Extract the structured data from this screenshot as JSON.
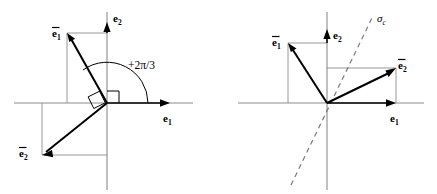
{
  "figure": {
    "width": 437,
    "height": 194,
    "background": "#ffffff",
    "panels": [
      {
        "id": "left-panel",
        "name": "rotation-by-2pi-over-3",
        "origin": {
          "x": 107,
          "y": 103
        },
        "axes": {
          "horizontal_label": "e",
          "horizontal_sub": "1",
          "vertical_label": "e",
          "vertical_sub": "2"
        },
        "angle_annotation": "+2π/3",
        "vectors": [
          {
            "name": "e1-bar",
            "label": "e",
            "sub": "1",
            "overbar": true,
            "tip_x": 67,
            "tip_y": 33
          },
          {
            "name": "e2-bar",
            "label": "e",
            "sub": "2",
            "overbar": true,
            "tip_x": 42,
            "tip_y": 155
          }
        ]
      },
      {
        "id": "right-panel",
        "name": "reflection-about-sigma-c",
        "origin": {
          "x": 327,
          "y": 103
        },
        "axes": {
          "horizontal_label": "e",
          "horizontal_sub": "1",
          "vertical_label": "e",
          "vertical_sub": "2"
        },
        "mirror_label": "σ",
        "mirror_sub": "c",
        "vectors": [
          {
            "name": "e1-bar",
            "label": "e",
            "sub": "1",
            "overbar": true,
            "tip_x": 288,
            "tip_y": 43
          },
          {
            "name": "e2-bar",
            "label": "e",
            "sub": "2",
            "overbar": true,
            "tip_x": 396,
            "tip_y": 68
          }
        ]
      }
    ],
    "colors": {
      "axis": "#8b8b8b",
      "vector": "#000000",
      "projection": "#8d8d8d",
      "dashed": "#7a7a7a",
      "text": "#000000"
    }
  },
  "labels": {
    "left": {
      "e1_axis": "e",
      "e1_axis_sub": "1",
      "e2_axis": "e",
      "e2_axis_sub": "2",
      "e1_bar": "e",
      "e1_bar_sub": "1",
      "e2_bar": "e",
      "e2_bar_sub": "2",
      "angle": "+2π/3"
    },
    "right": {
      "e1_axis": "e",
      "e1_axis_sub": "1",
      "e2_axis": "e",
      "e2_axis_sub": "2",
      "e1_bar": "e",
      "e1_bar_sub": "1",
      "e2_bar": "e",
      "e2_bar_sub": "2",
      "sigma": "σ",
      "sigma_sub": "c"
    }
  }
}
